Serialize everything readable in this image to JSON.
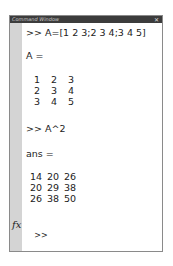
{
  "window": {
    "title": "Command Window",
    "close_icon": "close-icon"
  },
  "session": [
    {
      "type": "command",
      "prompt": ">>",
      "text": "A=[1 2 3;2 3 4;3 4 5]"
    },
    {
      "type": "output_label",
      "text": "A ="
    },
    {
      "type": "matrix",
      "rows": [
        [
          1,
          2,
          3
        ],
        [
          2,
          3,
          4
        ],
        [
          3,
          4,
          5
        ]
      ]
    },
    {
      "type": "command",
      "prompt": ">>",
      "text": "A^2"
    },
    {
      "type": "output_label",
      "text": "ans ="
    },
    {
      "type": "matrix",
      "rows": [
        [
          14,
          20,
          26
        ],
        [
          20,
          29,
          38
        ],
        [
          26,
          38,
          50
        ]
      ]
    }
  ],
  "cmd1": ">> A=[1 2 3;2 3 4;3 4 5]",
  "label1": "A =",
  "m1": [
    [
      "1",
      "2",
      "3"
    ],
    [
      "2",
      "3",
      "4"
    ],
    [
      "3",
      "4",
      "5"
    ]
  ],
  "cmd2": ">> A^2",
  "label2": "ans =",
  "m2": [
    [
      "14",
      "20",
      "26"
    ],
    [
      "20",
      "29",
      "38"
    ],
    [
      "26",
      "38",
      "50"
    ]
  ],
  "input": {
    "fx_icon": "fx",
    "prompt": ">>",
    "value": ""
  }
}
